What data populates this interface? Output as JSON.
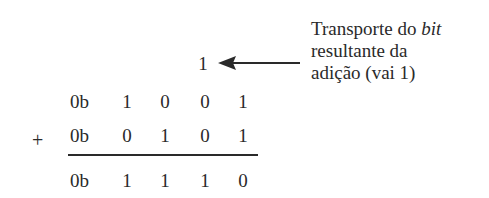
{
  "diagram": {
    "carry": {
      "value": "1",
      "column": 2
    },
    "operand_a": {
      "prefix": "0b",
      "bits": [
        "1",
        "0",
        "0",
        "1"
      ]
    },
    "operator": "+",
    "operand_b": {
      "prefix": "0b",
      "bits": [
        "0",
        "1",
        "0",
        "1"
      ]
    },
    "result": {
      "prefix": "0b",
      "bits": [
        "1",
        "1",
        "1",
        "0"
      ]
    },
    "annotation": {
      "line1_prefix": "Transporte do ",
      "line1_italic": "bit",
      "line2": "resultante da",
      "line3": "adição (vai 1)"
    },
    "colors": {
      "ink": "#2a2a2a",
      "background": "#ffffff"
    }
  }
}
